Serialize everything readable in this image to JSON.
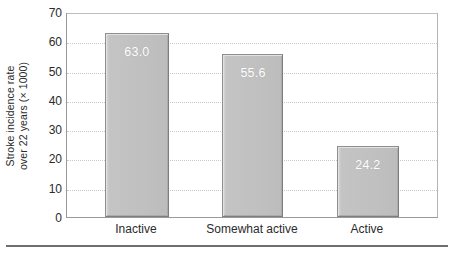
{
  "chart_data": {
    "type": "bar",
    "title": "",
    "subtitle": "",
    "xlabel": "",
    "ylabel_line1": "Stroke incidence rate",
    "ylabel_line2": "over 22 years (× 1000)",
    "categories": [
      "Inactive",
      "Somewhat active",
      "Active"
    ],
    "values": [
      63.0,
      55.6,
      24.2
    ],
    "value_labels": [
      "63.0",
      "55.6",
      "24.2"
    ],
    "ylim": [
      0,
      70
    ],
    "ytick_values": [
      70,
      60,
      50,
      40,
      30,
      20,
      10,
      0
    ],
    "ytick_labels": [
      "70",
      "60",
      "50",
      "40",
      "30",
      "20",
      "10",
      "0"
    ],
    "gridlines_at": [
      60,
      50,
      40,
      30,
      20,
      10
    ],
    "grid": true,
    "grid_style": "dotted",
    "legend": false,
    "legend_position": "none",
    "bar_color": "#c2c2c2",
    "bar_edge_color": "#8f8f8f",
    "value_label_color": "#ffffff",
    "axis_color": "#9a9a9a",
    "grid_color": "#c9c9c9",
    "text_color": "#2b2b2b",
    "bars": [
      {
        "category": "Inactive",
        "value": 63.0,
        "label": "63.0"
      },
      {
        "category": "Somewhat active",
        "value": 55.6,
        "label": "55.6"
      },
      {
        "category": "Active",
        "value": 24.2,
        "label": "24.2"
      }
    ]
  }
}
